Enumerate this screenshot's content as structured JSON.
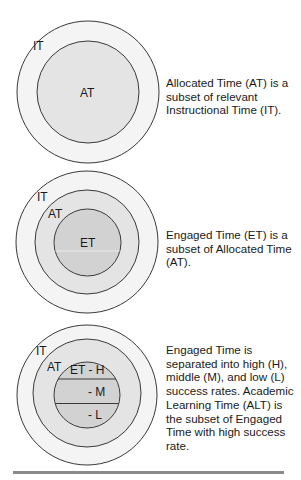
{
  "colors": {
    "instructional_time_fill": "#f4f4f4",
    "allocated_time_fill": "#e4e4e4",
    "engaged_time_fill": "#d2d2d2",
    "stroke": "#3a3a3a",
    "rule": "#8a8a8a"
  },
  "panels": [
    {
      "labels": {
        "it": "IT",
        "at": "AT"
      },
      "caption": "Allocated Time (AT) is a subset of relevant Instructional Time (IT)."
    },
    {
      "labels": {
        "it": "IT",
        "at": "AT",
        "et": "ET"
      },
      "caption": "Engaged Time (ET) is a subset of Allocated Time (AT)."
    },
    {
      "labels": {
        "it": "IT",
        "at": "AT",
        "et_h": "ET - H",
        "et_m": "- M",
        "et_l": "- L"
      },
      "caption": "Engaged Time is separated into high (H), middle (M), and low (L) success rates. Academic Learning Time (ALT) is the subset of Engaged Time with high success rate."
    }
  ]
}
